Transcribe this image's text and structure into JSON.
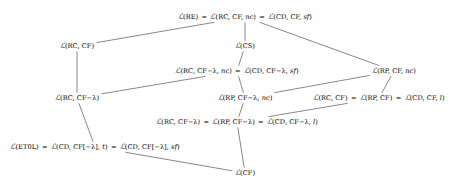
{
  "diagram": {
    "type": "hasse-diagram",
    "title": "",
    "line_color": "#555555",
    "text_color": "#000000",
    "background": "#ffffff",
    "nodes": [
      {
        "id": "n1",
        "label": "ℒ(RE) = ℒ(RC, CF, nc) = ℒ(CD, CF, sf)",
        "x": 245,
        "y": 17
      },
      {
        "id": "n2",
        "label": "ℒ(RC, CF)",
        "x": 77,
        "y": 46
      },
      {
        "id": "n3",
        "label": "ℒ(CS)",
        "x": 245,
        "y": 46
      },
      {
        "id": "n4",
        "label": "ℒ(RC, CF−λ, nc) = ℒ(CD, CF−λ, sf)",
        "x": 237,
        "y": 71
      },
      {
        "id": "n5",
        "label": "ℒ(RP, CF, nc)",
        "x": 394,
        "y": 71
      },
      {
        "id": "n6",
        "label": "ℒ(RC, CF−λ)",
        "x": 77,
        "y": 98
      },
      {
        "id": "n7",
        "label": "ℒ(RP, CF−λ, nc)",
        "x": 245,
        "y": 98
      },
      {
        "id": "n8",
        "label": "ℒ(RC, CF) = ℒ(RP, CF) = ℒ(CD, CF, l)",
        "x": 379,
        "y": 98
      },
      {
        "id": "n9",
        "label": "ℒ(RC, CF−λ) = ℒ(RP, CF−λ) = ℒ(CD, CF−λ, l)",
        "x": 237,
        "y": 122
      },
      {
        "id": "n10",
        "label": "ℒ(ET0L) = ℒ(CD, CF[−λ], t) = ℒ(CD, CF[−λ], sf)",
        "x": 95,
        "y": 147
      },
      {
        "id": "n11",
        "label": "ℒ(CF)",
        "x": 245,
        "y": 173
      }
    ],
    "edges": [
      {
        "from": "n1",
        "to": "n2",
        "note": "top to L(RC,CF)"
      },
      {
        "from": "n1",
        "to": "n3",
        "note": "top to L(CS)"
      },
      {
        "from": "n1",
        "to": "n5",
        "note": "top to L(RP,CF,nc)"
      },
      {
        "from": "n3",
        "to": "n4",
        "note": "L(CS) to L(RC,CF-lambda,nc)"
      },
      {
        "from": "n2",
        "to": "n6",
        "note": "L(RC,CF) to L(RC,CF-lambda)"
      },
      {
        "from": "n4",
        "to": "n6",
        "note": "L(RC,CF-lambda,nc) to L(RC,CF-lambda)"
      },
      {
        "from": "n4",
        "to": "n7",
        "note": "L(RC,CF-lambda,nc) to L(RP,CF-lambda,nc)"
      },
      {
        "from": "n5",
        "to": "n7",
        "note": "L(RP,CF,nc) to L(RP,CF-lambda,nc)"
      },
      {
        "from": "n5",
        "to": "n8",
        "note": "L(RP,CF,nc) to L(RC,CF)=L(RP,CF)"
      },
      {
        "from": "n7",
        "to": "n9",
        "note": "L(RP,CF-lambda,nc) to row5"
      },
      {
        "from": "n8",
        "to": "n9",
        "note": "L(RC,CF) to row5"
      },
      {
        "from": "n6",
        "to": "n10",
        "note": "L(RC,CF-lambda) to L(ET0L)"
      },
      {
        "from": "n9",
        "to": "n11",
        "note": "row5 to L(CF)"
      },
      {
        "from": "n10",
        "to": "n11",
        "note": "L(ET0L) to L(CF)"
      }
    ]
  }
}
